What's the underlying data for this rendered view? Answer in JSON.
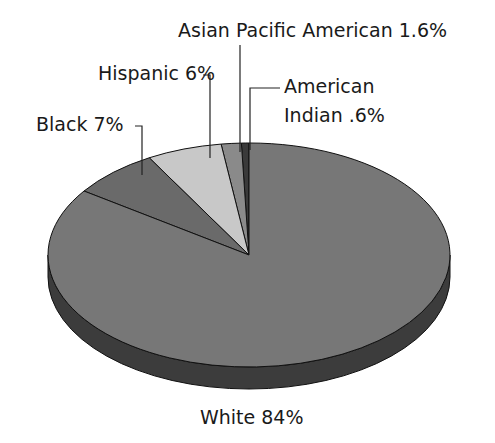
{
  "chart_data": {
    "type": "pie",
    "style": "3d",
    "title": "",
    "categories": [
      "American Indian",
      "Asian Pacific American",
      "Hispanic",
      "Black",
      "White"
    ],
    "values": [
      0.6,
      1.6,
      6,
      7,
      84
    ],
    "unit": "%",
    "labels": [
      {
        "lines": [
          "American",
          "Indian .6%"
        ]
      },
      {
        "lines": [
          "Asian Pacific American 1.6%"
        ]
      },
      {
        "lines": [
          "Hispanic 6%"
        ]
      },
      {
        "lines": [
          "Black 7%"
        ]
      },
      {
        "lines": [
          "White 84%"
        ]
      }
    ],
    "colors": [
      "#3a3a3a",
      "#8a8a8a",
      "#c8c8c8",
      "#6a6a6a",
      "#777777"
    ],
    "side_color": "#3c3c3c",
    "start_angle": "12 o'clock, counterclockwise",
    "legend": "none (leader-line labels)"
  }
}
